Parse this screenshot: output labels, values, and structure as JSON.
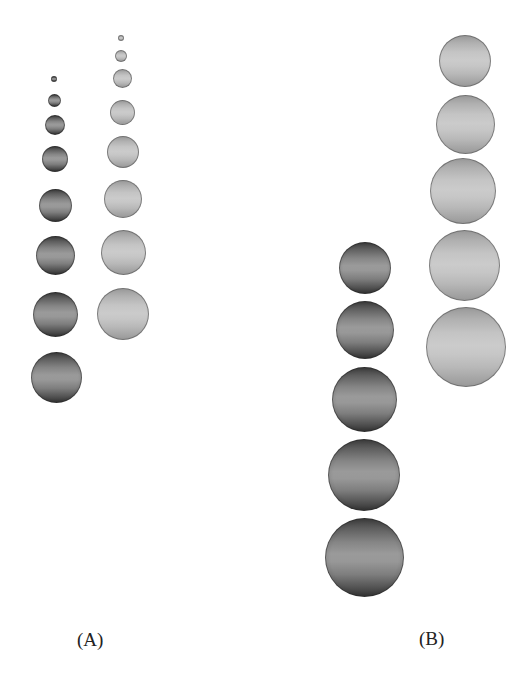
{
  "figure": {
    "panels": [
      {
        "id": "A",
        "label": "(A)",
        "label_pos": {
          "x": 77,
          "y": 630
        },
        "columns": [
          {
            "shade": "dark",
            "spheres": [
              {
                "cx": 54,
                "cy": 79,
                "r": 3
              },
              {
                "cx": 54,
                "cy": 100,
                "r": 6.5
              },
              {
                "cx": 55,
                "cy": 125,
                "r": 10
              },
              {
                "cx": 55,
                "cy": 159,
                "r": 13
              },
              {
                "cx": 55.5,
                "cy": 205,
                "r": 16.5
              },
              {
                "cx": 55.5,
                "cy": 255,
                "r": 19.5
              },
              {
                "cx": 55.5,
                "cy": 314,
                "r": 22.5
              },
              {
                "cx": 56,
                "cy": 377,
                "r": 25.5
              }
            ]
          },
          {
            "shade": "light",
            "spheres": [
              {
                "cx": 121,
                "cy": 38,
                "r": 3
              },
              {
                "cx": 121,
                "cy": 56,
                "r": 6
              },
              {
                "cx": 122,
                "cy": 78,
                "r": 9.5
              },
              {
                "cx": 122,
                "cy": 112,
                "r": 12.5
              },
              {
                "cx": 122.5,
                "cy": 152,
                "r": 16
              },
              {
                "cx": 123,
                "cy": 199,
                "r": 19
              },
              {
                "cx": 123,
                "cy": 252,
                "r": 22.5
              },
              {
                "cx": 123,
                "cy": 314,
                "r": 26
              }
            ]
          }
        ]
      },
      {
        "id": "B",
        "label": "(B)",
        "label_pos": {
          "x": 419,
          "y": 629
        },
        "columns": [
          {
            "shade": "dark",
            "spheres": [
              {
                "cx": 365,
                "cy": 268,
                "r": 26
              },
              {
                "cx": 364.5,
                "cy": 330,
                "r": 29
              },
              {
                "cx": 364,
                "cy": 399,
                "r": 32.5
              },
              {
                "cx": 364,
                "cy": 475,
                "r": 36
              },
              {
                "cx": 364,
                "cy": 557,
                "r": 39.5
              }
            ]
          },
          {
            "shade": "light",
            "spheres": [
              {
                "cx": 465,
                "cy": 61,
                "r": 26
              },
              {
                "cx": 465,
                "cy": 124,
                "r": 29.5
              },
              {
                "cx": 463,
                "cy": 191,
                "r": 33
              },
              {
                "cx": 464,
                "cy": 265.5,
                "r": 35.5
              },
              {
                "cx": 466,
                "cy": 347,
                "r": 40
              }
            ]
          }
        ]
      }
    ]
  },
  "colors": {
    "background": "#ffffff",
    "dark_sphere_edge": "#353535",
    "dark_sphere_center": "#9a9a9a",
    "light_sphere_edge": "#9a9a9a",
    "light_sphere_center": "#cbcbcb",
    "label_text": "#222222"
  }
}
